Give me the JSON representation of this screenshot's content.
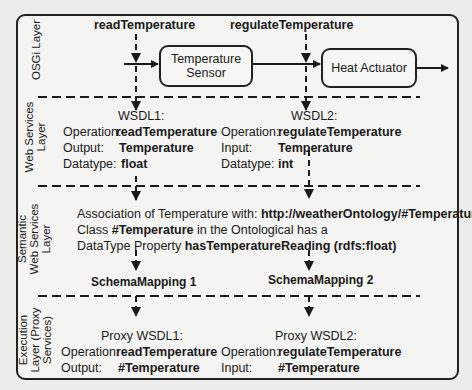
{
  "background_page": {
    "heading_conclusions": "Conclusions",
    "heading_references": "References"
  },
  "layers": {
    "osgi": "OSGi Layer",
    "web_services": [
      "Web Services",
      "Layer"
    ],
    "semantic": [
      "Semantic",
      "Web Services",
      "Layer"
    ],
    "execution": [
      "Execution",
      "Layer (Proxy",
      "Services)"
    ]
  },
  "osgi_layer": {
    "operation_left": "readTemperature",
    "operation_right": "regulateTemperature",
    "box_sensor": [
      "Temperature",
      "Sensor"
    ],
    "box_actuator": "Heat Actuator"
  },
  "web_services_layer": {
    "wsdl1": {
      "title": "WSDL1:",
      "rows": [
        {
          "label": "Operation:",
          "value": "readTemperature"
        },
        {
          "label": "Output:",
          "value": "Temperature"
        },
        {
          "label": "Datatype:",
          "value": "float"
        }
      ]
    },
    "wsdl2": {
      "title": "WSDL2:",
      "rows": [
        {
          "label": "Operation:",
          "value": "regulateTemperature"
        },
        {
          "label": "Input:",
          "value": "Temperature"
        },
        {
          "label": "Datatype:",
          "value": "int"
        }
      ]
    }
  },
  "semantic_layer": {
    "line1_prefix": "Association of Temperature with:",
    "line1_uri": "http://weatherOntology/#Temperature",
    "line2_prefix": "Class",
    "line2_class": "#Temperature",
    "line2_suffix": "in the Ontological has a",
    "line3_prefix": "DataType Property",
    "line3_property": "hasTemperatureReading (rdfs:float)",
    "mapping1": "SchemaMapping 1",
    "mapping2": "SchemaMapping 2"
  },
  "execution_layer": {
    "proxy1": {
      "title": "Proxy WSDL1:",
      "rows": [
        {
          "label": "Operation:",
          "value": "readTemperature"
        },
        {
          "label": "Output:",
          "value": "#Temperature"
        }
      ]
    },
    "proxy2": {
      "title": "Proxy WSDL2:",
      "rows": [
        {
          "label": "Operation:",
          "value": "regulateTemperature"
        },
        {
          "label": "Input:",
          "value": "#Temperature"
        }
      ]
    }
  }
}
